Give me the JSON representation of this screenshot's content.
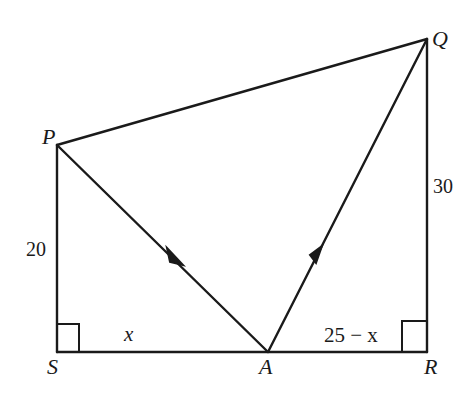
{
  "diagram": {
    "points": {
      "P": {
        "label": "P",
        "x": 57,
        "y": 145
      },
      "Q": {
        "label": "Q",
        "x": 427,
        "y": 39
      },
      "S": {
        "label": "S",
        "x": 57,
        "y": 352
      },
      "A": {
        "label": "A",
        "x": 268,
        "y": 352
      },
      "R": {
        "label": "R",
        "x": 427,
        "y": 352
      }
    },
    "segments": [
      {
        "from": "P",
        "to": "Q",
        "arrow": false
      },
      {
        "from": "P",
        "to": "S",
        "arrow": false
      },
      {
        "from": "S",
        "to": "R",
        "arrow": false
      },
      {
        "from": "R",
        "to": "Q",
        "arrow": false
      },
      {
        "from": "P",
        "to": "A",
        "arrow": true
      },
      {
        "from": "A",
        "to": "Q",
        "arrow": true
      }
    ],
    "lengths": {
      "PS": "20",
      "QR": "30",
      "SA": "x",
      "AR": "25 − x"
    },
    "right_angles": [
      "S",
      "R"
    ],
    "colors": {
      "line": "#1a1a1a",
      "background": "#ffffff"
    }
  }
}
